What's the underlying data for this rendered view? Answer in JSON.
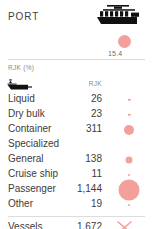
{
  "header": {
    "title": "PORT",
    "ship_icon": "cargo-ship-icon"
  },
  "kpi": {
    "value": "15.4",
    "bubble_icon": "kpi-bubble-marker"
  },
  "sub_header": {
    "unit_label": "RJK (%)",
    "boat_icon": "barge-boat-icon",
    "column_header": "RJK"
  },
  "chart_data": {
    "type": "table",
    "title": "PORT",
    "ylabel": "",
    "xlabel": "RJK",
    "categories": [
      "Liquid",
      "Dry bulk",
      "Container",
      "Specialized",
      "General",
      "Cruise ship",
      "Passenger",
      "Other"
    ],
    "values": [
      26,
      23,
      311,
      null,
      138,
      11,
      1144,
      19
    ],
    "value_labels": [
      "26",
      "23",
      "311",
      "",
      "138",
      "11",
      "1,144",
      "19"
    ],
    "bubble_sizes_px": [
      2.5,
      2.5,
      10,
      0,
      7,
      2,
      21,
      2
    ],
    "accent_color": "#f4a09a",
    "legend": [],
    "grid": false
  },
  "total": {
    "label": "Vessels",
    "value": "1,672",
    "mark_icon": "cross-marker-icon"
  },
  "colors": {
    "accent": "#f4a09a",
    "text": "#3c3c3c",
    "muted": "#8a8a8a",
    "rule": "#d8d8d8",
    "background": "#ffffff"
  }
}
